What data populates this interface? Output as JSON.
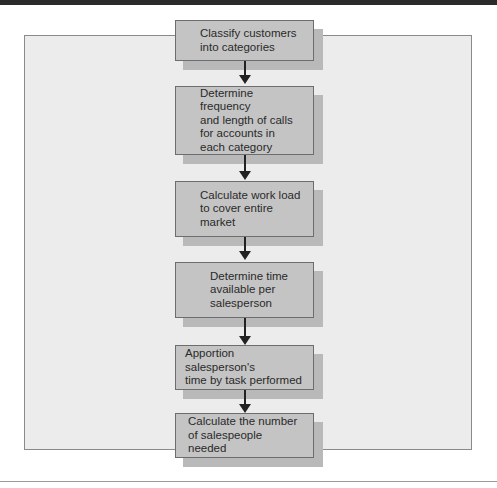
{
  "diagram": {
    "type": "flowchart",
    "direction": "top-to-bottom",
    "steps": [
      {
        "label": "Classify customers\ninto categories"
      },
      {
        "label": "Determine frequency\nand length of calls\nfor accounts in\neach category"
      },
      {
        "label": "Calculate work load\nto cover entire\nmarket"
      },
      {
        "label": "Determine time\navailable per\nsalesperson"
      },
      {
        "label": "Apportion salesperson's\ntime by task performed"
      },
      {
        "label": "Calculate the number\nof salespeople needed"
      }
    ],
    "colors": {
      "box_fill": "#c4c4c4",
      "box_shadow": "#b9b9b9",
      "frame_fill": "#ececec",
      "arrow": "#222222"
    }
  }
}
